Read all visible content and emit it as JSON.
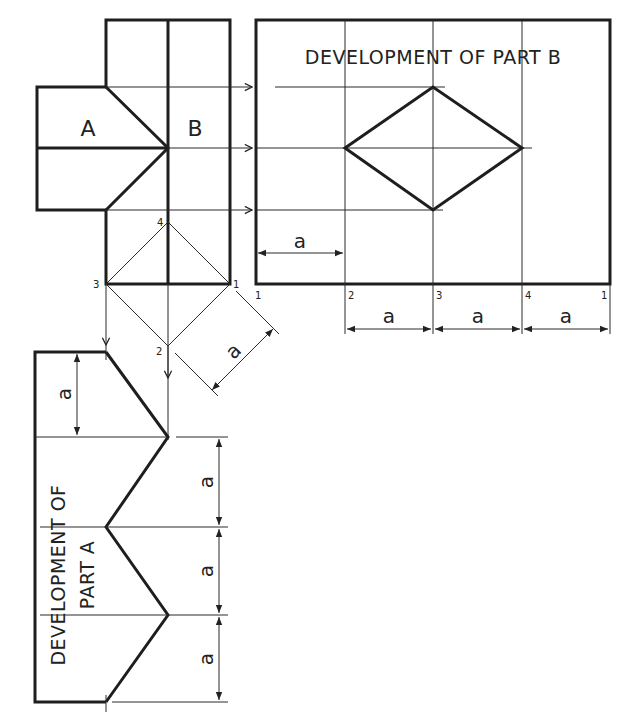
{
  "diagram": {
    "part_labels": {
      "a": "A",
      "b": "B"
    },
    "dev_b": {
      "title": "DEVELOPMENT OF PART B",
      "point_labels": [
        "1",
        "2",
        "3",
        "4",
        "1"
      ],
      "dimension_label": "a"
    },
    "dev_a": {
      "title_line1": "DEVELOPMENT OF",
      "title_line2": "PART  A",
      "dimension_label": "a"
    },
    "construction": {
      "point_labels": {
        "p1": "1",
        "p2": "2",
        "p3": "3",
        "p4": "4"
      },
      "dimension_label": "a"
    },
    "colors": {
      "line": "#1e1e1e",
      "background": "#ffffff"
    }
  }
}
